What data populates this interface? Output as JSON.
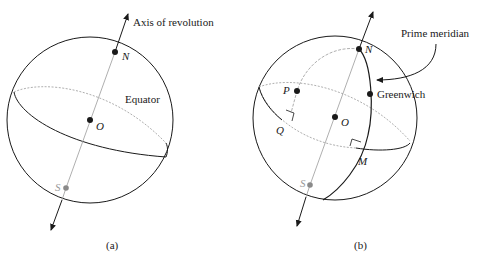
{
  "figure_a": {
    "caption": "(a)",
    "labels": {
      "axis": "Axis of revolution",
      "equator": "Equator",
      "north": "N",
      "center": "O",
      "south": "S"
    }
  },
  "figure_b": {
    "caption": "(b)",
    "labels": {
      "prime_meridian": "Prime meridian",
      "greenwich": "Greenwich",
      "north": "N",
      "center": "O",
      "south": "S",
      "point_p": "P",
      "point_q": "Q",
      "point_m": "M"
    }
  },
  "colors": {
    "stroke": "#1a1a1a",
    "hidden": "#9a9a9a",
    "south_point": "#8a8a8a"
  }
}
